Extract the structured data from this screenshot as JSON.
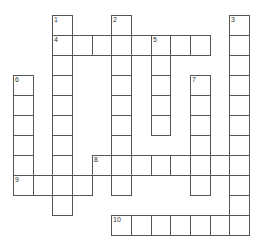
{
  "puzzle": {
    "type": "crossword",
    "grid": {
      "cols": 12,
      "rows": 11,
      "origin_x": 13,
      "origin_y": 15,
      "cell_w": 19.67,
      "cell_h": 20
    },
    "colors": {
      "line": "#555555",
      "background": "#ffffff",
      "number": "#333333"
    },
    "entries": [
      {
        "number": "1",
        "direction": "down",
        "row": 0,
        "col": 2,
        "length": 10
      },
      {
        "number": "2",
        "direction": "down",
        "row": 0,
        "col": 5,
        "length": 9
      },
      {
        "number": "3",
        "direction": "down",
        "row": 0,
        "col": 11,
        "length": 11
      },
      {
        "number": "4",
        "direction": "across",
        "row": 1,
        "col": 2,
        "length": 8
      },
      {
        "number": "5",
        "direction": "down",
        "row": 1,
        "col": 7,
        "length": 5
      },
      {
        "number": "6",
        "direction": "down",
        "row": 3,
        "col": 0,
        "length": 6
      },
      {
        "number": "7",
        "direction": "down",
        "row": 3,
        "col": 9,
        "length": 6
      },
      {
        "number": "8",
        "direction": "across",
        "row": 7,
        "col": 4,
        "length": 8
      },
      {
        "number": "9",
        "direction": "across",
        "row": 8,
        "col": 0,
        "length": 4
      },
      {
        "number": "10",
        "direction": "across",
        "row": 10,
        "col": 5,
        "length": 7
      }
    ]
  }
}
